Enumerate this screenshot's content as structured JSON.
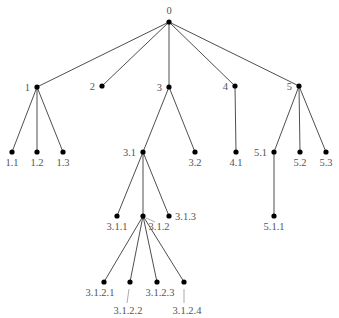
{
  "diagram": {
    "type": "tree",
    "colors": {
      "edge": "#3a3a3a",
      "node": "#000000",
      "label": "#555555",
      "background": "#ffffff"
    },
    "nodes": [
      {
        "id": "0",
        "label": "0",
        "x": 169,
        "y": 22,
        "lx": 169,
        "ly": 14,
        "anchor": "middle"
      },
      {
        "id": "1",
        "label": "1",
        "x": 37,
        "y": 87,
        "lx": 30,
        "ly": 91,
        "anchor": "end"
      },
      {
        "id": "2",
        "label": "2",
        "x": 102,
        "y": 86,
        "lx": 95,
        "ly": 90,
        "anchor": "end"
      },
      {
        "id": "3",
        "label": "3",
        "x": 169,
        "y": 87,
        "lx": 162,
        "ly": 91,
        "anchor": "end"
      },
      {
        "id": "4",
        "label": "4",
        "x": 235,
        "y": 86,
        "lx": 228,
        "ly": 90,
        "anchor": "end"
      },
      {
        "id": "5",
        "label": "5",
        "x": 299,
        "y": 86,
        "lx": 292,
        "ly": 90,
        "anchor": "end"
      },
      {
        "id": "1.1",
        "label": "1.1",
        "x": 12,
        "y": 152,
        "lx": 12,
        "ly": 166,
        "anchor": "middle"
      },
      {
        "id": "1.2",
        "label": "1.2",
        "x": 37,
        "y": 152,
        "lx": 37,
        "ly": 166,
        "anchor": "middle"
      },
      {
        "id": "1.3",
        "label": "1.3",
        "x": 63,
        "y": 152,
        "lx": 63,
        "ly": 166,
        "anchor": "middle"
      },
      {
        "id": "3.1",
        "label": "3.1",
        "x": 143,
        "y": 152,
        "lx": 136,
        "ly": 156,
        "anchor": "end"
      },
      {
        "id": "3.2",
        "label": "3.2",
        "x": 195,
        "y": 152,
        "lx": 195,
        "ly": 166,
        "anchor": "middle"
      },
      {
        "id": "4.1",
        "label": "4.1",
        "x": 236,
        "y": 152,
        "lx": 236,
        "ly": 166,
        "anchor": "middle"
      },
      {
        "id": "5.1",
        "label": "5.1",
        "x": 274,
        "y": 152,
        "lx": 267,
        "ly": 156,
        "anchor": "end"
      },
      {
        "id": "5.2",
        "label": "5.2",
        "x": 300,
        "y": 152,
        "lx": 300,
        "ly": 166,
        "anchor": "middle"
      },
      {
        "id": "5.3",
        "label": "5.3",
        "x": 326,
        "y": 152,
        "lx": 326,
        "ly": 166,
        "anchor": "middle"
      },
      {
        "id": "3.1.1",
        "label": "3.1.1",
        "x": 117,
        "y": 216,
        "lx": 117,
        "ly": 230,
        "anchor": "middle"
      },
      {
        "id": "3.1.2",
        "label": "3.1.2",
        "x": 143,
        "y": 216,
        "lx": 159,
        "ly": 230,
        "anchor": "middle"
      },
      {
        "id": "3.1.3",
        "label": "3.1.3",
        "x": 169,
        "y": 216,
        "lx": 175,
        "ly": 220,
        "anchor": "start"
      },
      {
        "id": "5.1.1",
        "label": "5.1.1",
        "x": 274,
        "y": 216,
        "lx": 274,
        "ly": 230,
        "anchor": "middle"
      },
      {
        "id": "3.1.2.1",
        "label": "3.1.2.1",
        "x": 104,
        "y": 282,
        "lx": 100,
        "ly": 296,
        "anchor": "middle"
      },
      {
        "id": "3.1.2.2",
        "label": "3.1.2.2",
        "x": 130,
        "y": 282,
        "lx": 128,
        "ly": 314,
        "anchor": "middle"
      },
      {
        "id": "3.1.2.3",
        "label": "3.1.2.3",
        "x": 157,
        "y": 282,
        "lx": 160,
        "ly": 296,
        "anchor": "middle"
      },
      {
        "id": "3.1.2.4",
        "label": "3.1.2.4",
        "x": 184,
        "y": 282,
        "lx": 187,
        "ly": 314,
        "anchor": "middle"
      }
    ],
    "edges": [
      [
        "0",
        "1"
      ],
      [
        "0",
        "2"
      ],
      [
        "0",
        "3"
      ],
      [
        "0",
        "4"
      ],
      [
        "0",
        "5"
      ],
      [
        "1",
        "1.1"
      ],
      [
        "1",
        "1.2"
      ],
      [
        "1",
        "1.3"
      ],
      [
        "3",
        "3.1"
      ],
      [
        "3",
        "3.2"
      ],
      [
        "4",
        "4.1"
      ],
      [
        "5",
        "5.1"
      ],
      [
        "5",
        "5.2"
      ],
      [
        "5",
        "5.3"
      ],
      [
        "3.1",
        "3.1.1"
      ],
      [
        "3.1",
        "3.1.2"
      ],
      [
        "3.1",
        "3.1.3"
      ],
      [
        "5.1",
        "5.1.1"
      ],
      [
        "3.1.2",
        "3.1.2.1"
      ],
      [
        "3.1.2",
        "3.1.2.2"
      ],
      [
        "3.1.2",
        "3.1.2.3"
      ],
      [
        "3.1.2",
        "3.1.2.4"
      ]
    ],
    "leaders": [
      {
        "for": "3.1.2",
        "x1": 146,
        "y1": 218,
        "x2": 155,
        "y2": 222
      },
      {
        "for": "3.1.2.2",
        "x1": 129,
        "y1": 289,
        "x2": 127,
        "y2": 303
      },
      {
        "for": "3.1.2.4",
        "x1": 184,
        "y1": 289,
        "x2": 184,
        "y2": 303
      }
    ]
  }
}
